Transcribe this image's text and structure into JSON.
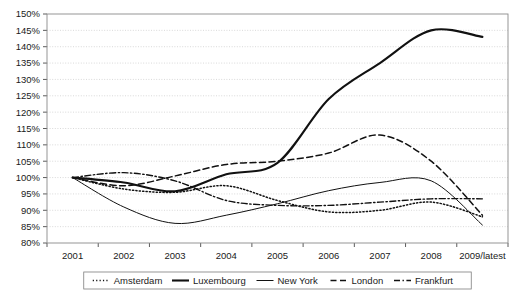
{
  "chart_data": {
    "type": "line",
    "title": "",
    "xlabel": "",
    "ylabel": "",
    "categories": [
      "2001",
      "2002",
      "2003",
      "2004",
      "2005",
      "2006",
      "2007",
      "2008",
      "2009/latest"
    ],
    "x_tick_labels": [
      "2001",
      "2002",
      "2003",
      "2004",
      "2005",
      "2006",
      "2007",
      "2008",
      "2009/latest"
    ],
    "y_tick_labels": [
      "80%",
      "85%",
      "90%",
      "95%",
      "100%",
      "105%",
      "110%",
      "115%",
      "120%",
      "125%",
      "130%",
      "135%",
      "140%",
      "145%",
      "150%"
    ],
    "y_tick_values": [
      80,
      85,
      90,
      95,
      100,
      105,
      110,
      115,
      120,
      125,
      130,
      135,
      140,
      145,
      150
    ],
    "ylim": [
      80,
      150
    ],
    "y_tick_step": 5,
    "y_unit": "%",
    "grid": true,
    "grid_axis": "y",
    "legend_position": "bottom",
    "series": [
      {
        "name": "Amsterdam",
        "style": "dotted",
        "color": "#111111",
        "values": [
          100,
          96.5,
          95.5,
          97.5,
          93,
          89.5,
          90,
          92.5,
          88
        ]
      },
      {
        "name": "Luxembourg",
        "style": "solid-thick",
        "color": "#111111",
        "values": [
          100,
          98.5,
          95.8,
          101,
          104.5,
          124,
          135,
          145,
          143
        ]
      },
      {
        "name": "New York",
        "style": "solid-thin",
        "color": "#111111",
        "values": [
          100,
          91,
          86,
          88.5,
          92,
          96,
          98.5,
          99,
          85.5
        ]
      },
      {
        "name": "London",
        "style": "dashed",
        "color": "#111111",
        "values": [
          100,
          97.5,
          100.5,
          104,
          105,
          107.5,
          113,
          105,
          88.5
        ]
      },
      {
        "name": "Frankfurt",
        "style": "dash-dot",
        "color": "#111111",
        "values": [
          100,
          101.5,
          99,
          93,
          91.5,
          91.5,
          92.5,
          93.5,
          93.5
        ]
      }
    ]
  },
  "legend": {
    "entries": [
      {
        "label": "Amsterdam",
        "style": "dotted"
      },
      {
        "label": "Luxembourg",
        "style": "solid-thick"
      },
      {
        "label": "New York",
        "style": "solid-thin"
      },
      {
        "label": "London",
        "style": "dashed"
      },
      {
        "label": "Frankfurt",
        "style": "dash-dot"
      }
    ]
  }
}
